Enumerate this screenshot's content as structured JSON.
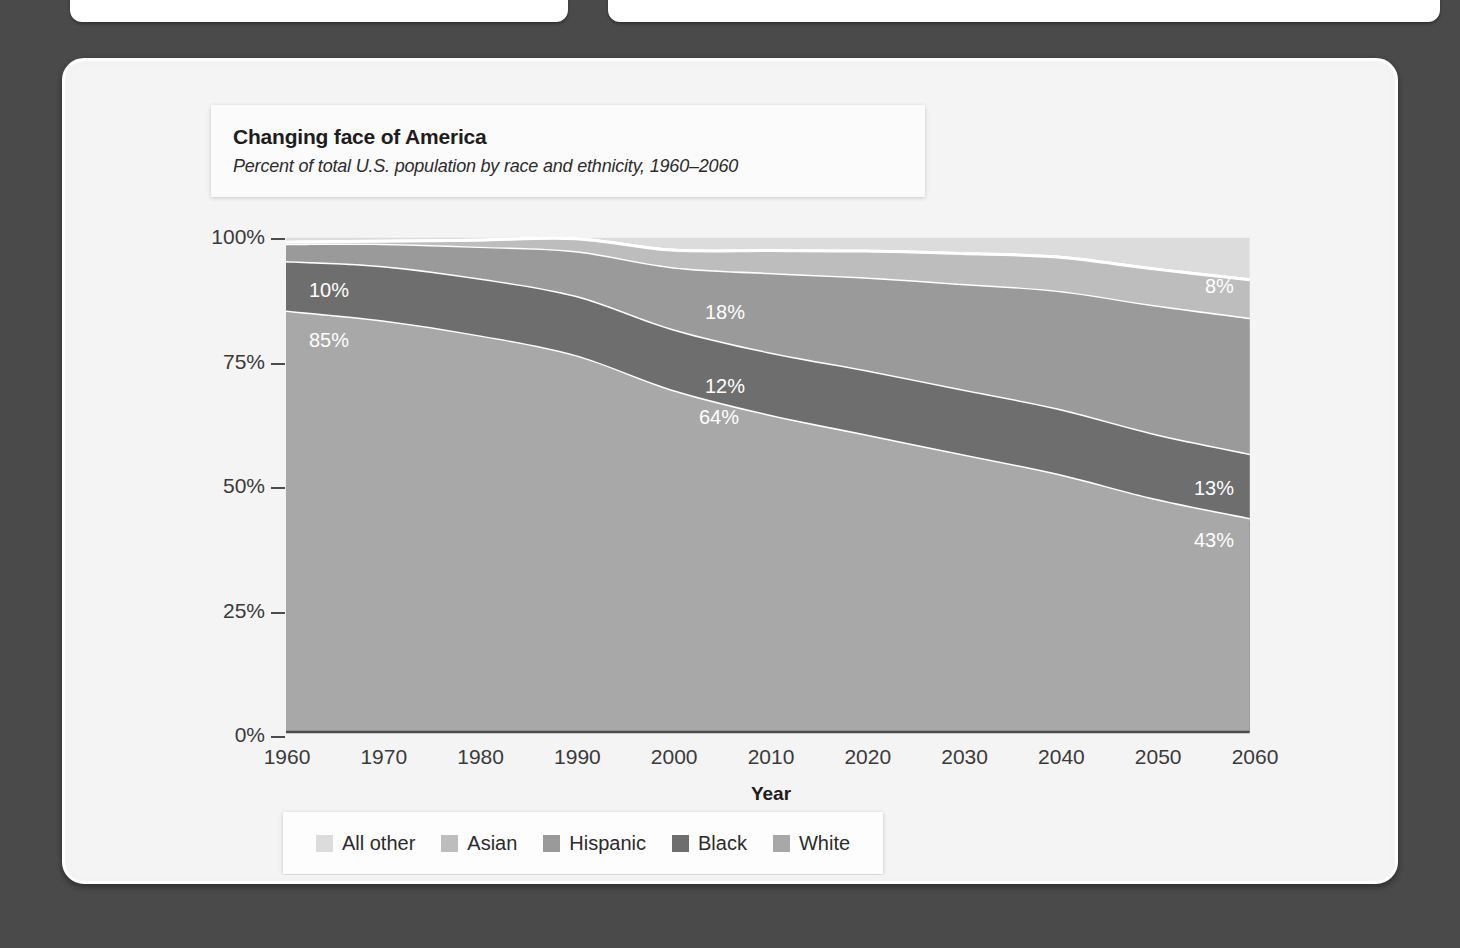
{
  "panels": {
    "top_left_panel": "",
    "top_right_panel": ""
  },
  "header": {
    "title": "Changing face of America",
    "subtitle": "Percent of total U.S. population by race and ethnicity, 1960–2060"
  },
  "legend": {
    "position": "bottom-center",
    "items": [
      {
        "label": "All other",
        "color": "#dcdcdc"
      },
      {
        "label": "Asian",
        "color": "#bdbdbd"
      },
      {
        "label": "Hispanic",
        "color": "#9a9a9a"
      },
      {
        "label": "Black",
        "color": "#6e6e6e"
      },
      {
        "label": "White",
        "color": "#a8a8a8"
      }
    ]
  },
  "axes": {
    "y_ticks": [
      "0%",
      "25%",
      "50%",
      "75%",
      "100%"
    ],
    "x_ticks": [
      "1960",
      "1970",
      "1980",
      "1990",
      "2000",
      "2010",
      "2020",
      "2030",
      "2040",
      "2050",
      "2060"
    ],
    "x_title": "Year",
    "y_title": ""
  },
  "annotations": [
    {
      "text": "10%",
      "x": 300,
      "y": 268
    },
    {
      "text": "85%",
      "x": 300,
      "y": 318
    },
    {
      "text": "18%",
      "x": 696,
      "y": 290
    },
    {
      "text": "12%",
      "x": 696,
      "y": 364
    },
    {
      "text": "64%",
      "x": 690,
      "y": 395
    },
    {
      "text": "8%",
      "x": 1196,
      "y": 264
    },
    {
      "text": "13%",
      "x": 1185,
      "y": 466
    },
    {
      "text": "43%",
      "x": 1185,
      "y": 518
    }
  ],
  "chart_data": {
    "type": "area",
    "stacked": true,
    "normalized": true,
    "title": "Changing face of America",
    "subtitle": "Percent of total U.S. population by race and ethnicity, 1960–2060",
    "xlabel": "Year",
    "ylabel": "",
    "xlim": [
      1960,
      2060
    ],
    "ylim": [
      0,
      100
    ],
    "ytick_values": [
      0,
      25,
      50,
      75,
      100
    ],
    "ytick_labels": [
      "0%",
      "25%",
      "50%",
      "75%",
      "100%"
    ],
    "grid": false,
    "legend_position": "bottom",
    "x": [
      1960,
      1970,
      1980,
      1990,
      2000,
      2010,
      2020,
      2030,
      2040,
      2050,
      2060
    ],
    "stack_order_bottom_to_top": [
      "White",
      "Black",
      "Hispanic",
      "Asian",
      "All other"
    ],
    "series": [
      {
        "name": "White",
        "color": "#a8a8a8",
        "values": [
          85,
          83,
          80,
          76,
          69,
          64,
          60,
          56,
          52,
          47,
          43
        ]
      },
      {
        "name": "Black",
        "color": "#6e6e6e",
        "values": [
          10,
          11,
          11.5,
          12,
          12.3,
          12.6,
          13,
          13.1,
          13.2,
          13.1,
          13
        ]
      },
      {
        "name": "Hispanic",
        "color": "#9a9a9a",
        "values": [
          3.5,
          4.5,
          6.4,
          9,
          12.5,
          16,
          18.7,
          21.3,
          23.8,
          26,
          27.5
        ]
      },
      {
        "name": "Asian",
        "color": "#bdbdbd",
        "values": [
          0.6,
          0.8,
          1.6,
          2.8,
          3.7,
          4.8,
          5.6,
          6.4,
          7.1,
          7.6,
          8
        ]
      },
      {
        "name": "All other",
        "color": "#dcdcdc",
        "values": [
          0.9,
          0.7,
          0.5,
          0.2,
          2.5,
          2.6,
          2.7,
          3.2,
          3.9,
          6.3,
          8.5
        ]
      }
    ],
    "data_labels": [
      {
        "series": "Black",
        "year": 1960,
        "value": "10%"
      },
      {
        "series": "White",
        "year": 1960,
        "value": "85%"
      },
      {
        "series": "Hispanic",
        "year": 2005,
        "value": "18%"
      },
      {
        "series": "Black",
        "year": 2005,
        "value": "12%"
      },
      {
        "series": "White",
        "year": 2005,
        "value": "64%"
      },
      {
        "series": "Asian",
        "year": 2055,
        "value": "8%"
      },
      {
        "series": "Black",
        "year": 2055,
        "value": "13%"
      },
      {
        "series": "White",
        "year": 2055,
        "value": "43%"
      }
    ]
  }
}
